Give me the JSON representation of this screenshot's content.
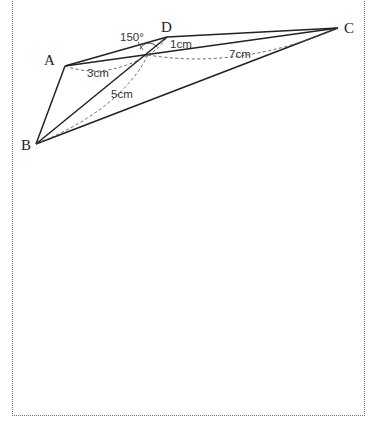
{
  "figure": {
    "type": "geometry-diagram",
    "vertices": [
      {
        "label": "A",
        "x": 65,
        "y": 66
      },
      {
        "label": "B",
        "x": 36,
        "y": 144
      },
      {
        "label": "C",
        "x": 338,
        "y": 28
      },
      {
        "label": "D",
        "x": 167,
        "y": 37
      }
    ],
    "intersection_point": {
      "x": 148,
      "y": 55
    },
    "measurements": {
      "angle": "150°",
      "d_to_point": "1cm",
      "a_to_point": "3cm",
      "b_to_point": "5cm",
      "c_to_point": "7cm"
    }
  },
  "colors": {
    "line": "#222222",
    "dashed": "#555555",
    "border": "#777777"
  }
}
